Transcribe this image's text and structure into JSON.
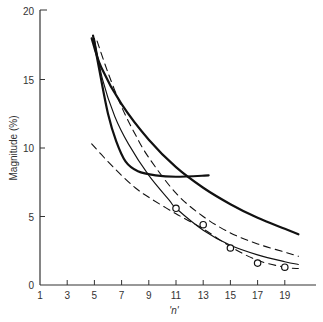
{
  "chart_data": {
    "type": "line",
    "title": "",
    "xlabel": "'n'",
    "ylabel": "Magnitude (%)",
    "xlim": [
      1,
      21
    ],
    "ylim": [
      0,
      20
    ],
    "x_ticks": [
      1,
      3,
      5,
      7,
      9,
      11,
      13,
      15,
      17,
      19
    ],
    "y_ticks": [
      0,
      5,
      10,
      15,
      20
    ],
    "grid": false,
    "legend": null,
    "series": [
      {
        "name": "thick-solid-long",
        "style": "solid",
        "width": 2.2,
        "points": [
          [
            4.8,
            18.0
          ],
          [
            5.5,
            15.9
          ],
          [
            7,
            13.2
          ],
          [
            9,
            10.6
          ],
          [
            11,
            8.6
          ],
          [
            13,
            7.1
          ],
          [
            15,
            5.9
          ],
          [
            17,
            4.9
          ],
          [
            19,
            4.1
          ],
          [
            20,
            3.7
          ]
        ]
      },
      {
        "name": "thick-solid-plateau",
        "style": "solid",
        "width": 2.2,
        "points": [
          [
            4.9,
            18.2
          ],
          [
            5.4,
            15.5
          ],
          [
            6,
            12.5
          ],
          [
            6.6,
            10.5
          ],
          [
            7.3,
            9.0
          ],
          [
            8.2,
            8.3
          ],
          [
            9.5,
            8.0
          ],
          [
            11,
            7.9
          ],
          [
            13.4,
            8.0
          ]
        ]
      },
      {
        "name": "thin-solid",
        "style": "solid",
        "width": 1.1,
        "points": [
          [
            5.0,
            18.0
          ],
          [
            5.6,
            15.0
          ],
          [
            6.5,
            12.3
          ],
          [
            7.5,
            10.3
          ],
          [
            9,
            8.0
          ],
          [
            10.5,
            6.2
          ],
          [
            11,
            5.6
          ],
          [
            13,
            4.0
          ],
          [
            15,
            2.9
          ],
          [
            17,
            2.2
          ],
          [
            19,
            1.7
          ],
          [
            20,
            1.5
          ]
        ]
      },
      {
        "name": "dashed-upper",
        "style": "dashed",
        "width": 1.1,
        "points": [
          [
            5.2,
            17.8
          ],
          [
            6,
            15.5
          ],
          [
            7,
            13.0
          ],
          [
            8,
            11.0
          ],
          [
            9,
            9.3
          ],
          [
            11,
            6.7
          ],
          [
            13,
            5.0
          ],
          [
            15,
            3.8
          ],
          [
            17,
            3.0
          ],
          [
            19,
            2.4
          ],
          [
            20,
            2.1
          ]
        ]
      },
      {
        "name": "dashed-lower",
        "style": "dashed",
        "width": 1.1,
        "points": [
          [
            4.8,
            10.3
          ],
          [
            6,
            9.0
          ],
          [
            7,
            8.0
          ],
          [
            8,
            7.1
          ],
          [
            9,
            6.4
          ],
          [
            11,
            5.2
          ],
          [
            13,
            4.1
          ],
          [
            15,
            2.8
          ],
          [
            17,
            1.8
          ],
          [
            19,
            1.3
          ],
          [
            20,
            1.2
          ]
        ]
      }
    ],
    "markers": {
      "name": "observed",
      "shape": "open-circle",
      "points": [
        [
          11,
          5.6
        ],
        [
          13,
          4.4
        ],
        [
          15,
          2.7
        ],
        [
          17,
          1.6
        ],
        [
          19,
          1.3
        ]
      ]
    }
  },
  "labels": {
    "ylabel": "Magnitude (%)",
    "xlabel": "'n'"
  }
}
